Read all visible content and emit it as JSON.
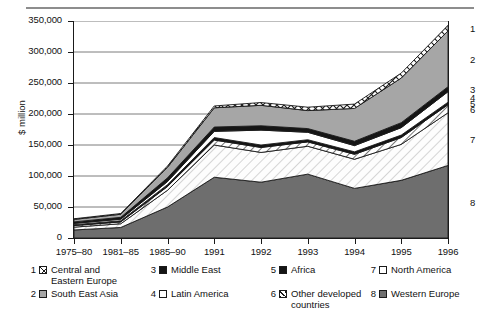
{
  "chart_data": {
    "type": "area",
    "stacked": true,
    "title": "",
    "xlabel": "",
    "ylabel": "$ million",
    "ylim": [
      0,
      350000
    ],
    "ytick_values": [
      0,
      50000,
      100000,
      150000,
      200000,
      250000,
      300000,
      350000
    ],
    "ytick_labels": [
      "0",
      "50,000",
      "100,000",
      "150,000",
      "200,000",
      "250,000",
      "300,000",
      "350,000"
    ],
    "categories": [
      "1975–80",
      "1981–85",
      "1985–90",
      "1991",
      "1992",
      "1993",
      "1994",
      "1995",
      "1996"
    ],
    "grid": "horizontal",
    "legend_position": "below",
    "stack_order_bottom_to_top": [
      8,
      7,
      6,
      5,
      4,
      3,
      2,
      1
    ],
    "series": [
      {
        "key": 1,
        "name": "Central and Eastern Europe",
        "pattern": "cross-hatch",
        "values": [
          1000,
          1200,
          2000,
          3000,
          4500,
          5500,
          7000,
          8000,
          9000
        ]
      },
      {
        "key": 2,
        "name": "South East Asia",
        "pattern": "medium-gray",
        "values": [
          4000,
          5000,
          17000,
          31000,
          33000,
          29000,
          53000,
          72000,
          90000
        ]
      },
      {
        "key": 3,
        "name": "Middle East",
        "pattern": "black",
        "values": [
          2500,
          3000,
          6000,
          7000,
          7000,
          6000,
          7000,
          8000,
          8000
        ]
      },
      {
        "key": 4,
        "name": "Latin America",
        "pattern": "white",
        "values": [
          2000,
          2500,
          5000,
          10000,
          24000,
          12000,
          10000,
          12000,
          17000
        ]
      },
      {
        "key": 5,
        "name": "Africa",
        "pattern": "black",
        "values": [
          1500,
          1800,
          3000,
          4000,
          4000,
          3500,
          4000,
          4000,
          4000
        ]
      },
      {
        "key": 6,
        "name": "Other developed countries",
        "pattern": "diagonal-hatch",
        "values": [
          2500,
          3000,
          6000,
          8000,
          8000,
          7000,
          8000,
          11000,
          13000
        ]
      },
      {
        "key": 7,
        "name": "North America",
        "pattern": "light-diagonal-hatch",
        "values": [
          4500,
          6000,
          27000,
          52000,
          48000,
          45000,
          47000,
          58000,
          85000
        ]
      },
      {
        "key": 8,
        "name": "Western Europe",
        "pattern": "dark-gray",
        "values": [
          13000,
          17000,
          50000,
          98000,
          90000,
          103000,
          80000,
          93000,
          117000
        ]
      }
    ],
    "totals": [
      31000,
      39500,
      116000,
      213000,
      218500,
      211000,
      216000,
      266000,
      343000
    ],
    "right_edge_labels": [
      "1",
      "2",
      "3",
      "4",
      "5",
      "6",
      "7",
      "8"
    ]
  },
  "legend": {
    "items": [
      {
        "num": "1",
        "label_line1": "Central and",
        "label_line2": "Eastern Europe",
        "swatch": "cross-hatch"
      },
      {
        "num": "2",
        "label_line1": "South East Asia",
        "label_line2": "",
        "swatch": "medium-gray"
      },
      {
        "num": "3",
        "label_line1": "Middle East",
        "label_line2": "",
        "swatch": "black"
      },
      {
        "num": "4",
        "label_line1": "Latin America",
        "label_line2": "",
        "swatch": "white"
      },
      {
        "num": "5",
        "label_line1": "Africa",
        "label_line2": "",
        "swatch": "black"
      },
      {
        "num": "6",
        "label_line1": "Other developed",
        "label_line2": "countries",
        "swatch": "diagonal-hatch"
      },
      {
        "num": "7",
        "label_line1": "North America",
        "label_line2": "",
        "swatch": "white"
      },
      {
        "num": "8",
        "label_line1": "Western Europe",
        "label_line2": "",
        "swatch": "dark-gray"
      }
    ]
  },
  "colors": {
    "axis": "#1a1a1a",
    "grid": "#6e6e6e",
    "rule": "#8d8d8d",
    "dark_gray": "#6e6e6e",
    "mid_gray": "#a6a6a6",
    "black": "#151515",
    "white": "#ffffff"
  }
}
